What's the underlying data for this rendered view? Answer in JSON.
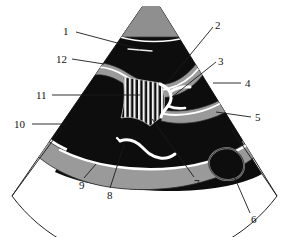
{
  "figure": {
    "type": "ultrasound-sector-scan-diagram",
    "background_color": "#ffffff",
    "sector_fill_color": "#ffffff",
    "tissue_color": "#0d0d0d",
    "band_color": "#9a9a9a",
    "highlight_color": "#ffffff",
    "outline_color": "#222222",
    "transducer_color": "#8f8f8f"
  },
  "labels": [
    {
      "id": "1",
      "text": "1",
      "x": 63,
      "y": 26
    },
    {
      "id": "2",
      "text": "2",
      "x": 215,
      "y": 20
    },
    {
      "id": "3",
      "text": "3",
      "x": 218,
      "y": 56
    },
    {
      "id": "4",
      "text": "4",
      "x": 245,
      "y": 79
    },
    {
      "id": "5",
      "text": "5",
      "x": 255,
      "y": 113
    },
    {
      "id": "6",
      "text": "6",
      "x": 251,
      "y": 219
    },
    {
      "id": "7",
      "text": "7",
      "x": 195,
      "y": 182
    },
    {
      "id": "8",
      "text": "8",
      "x": 108,
      "y": 194
    },
    {
      "id": "9",
      "text": "9",
      "x": 80,
      "y": 184
    },
    {
      "id": "10",
      "text": "10",
      "x": 16,
      "y": 120
    },
    {
      "id": "11",
      "text": "11",
      "x": 38,
      "y": 91
    },
    {
      "id": "12",
      "text": "12",
      "x": 58,
      "y": 55
    }
  ],
  "leader_lines": [
    {
      "id": "leader-1",
      "from": [
        76,
        32
      ],
      "to": [
        140,
        49
      ]
    },
    {
      "id": "leader-2",
      "from": [
        213,
        27
      ],
      "to": [
        167,
        83
      ]
    },
    {
      "id": "leader-3",
      "from": [
        216,
        62
      ],
      "to": [
        172,
        97
      ]
    },
    {
      "id": "leader-4",
      "from": [
        241,
        83
      ],
      "to": [
        213,
        83
      ]
    },
    {
      "id": "leader-5",
      "from": [
        251,
        117
      ],
      "to": [
        216,
        112
      ]
    },
    {
      "id": "leader-6",
      "from": [
        250,
        213
      ],
      "to": [
        235,
        176
      ]
    },
    {
      "id": "leader-7",
      "from": [
        194,
        177
      ],
      "to": [
        152,
        119
      ]
    },
    {
      "id": "leader-8",
      "from": [
        110,
        188
      ],
      "to": [
        124,
        148
      ]
    },
    {
      "id": "leader-9",
      "from": [
        84,
        178
      ],
      "to": [
        96,
        164
      ]
    },
    {
      "id": "leader-10",
      "from": [
        32,
        124
      ],
      "to": [
        66,
        124
      ]
    },
    {
      "id": "leader-11",
      "from": [
        52,
        95
      ],
      "to": [
        140,
        95
      ]
    },
    {
      "id": "leader-12",
      "from": [
        72,
        59
      ],
      "to": [
        104,
        64
      ]
    }
  ],
  "sector": {
    "apex_left_x": 142,
    "apex_right_x": 160,
    "apex_y": 7,
    "outer_arc_label": "sector-outer-boundary",
    "left_edge_label": "sector-left-edge",
    "right_edge_label": "sector-right-edge"
  },
  "structures": [
    {
      "name": "transducer-footprint",
      "shape": "trapezoid",
      "color": "#8f8f8f"
    },
    {
      "name": "upper-tissue-mass",
      "shape": "sector-wedge",
      "color": "#0d0d0d"
    },
    {
      "name": "upper-gray-band",
      "shape": "wavy-band",
      "color": "#9a9a9a"
    },
    {
      "name": "striped-region",
      "shape": "vertical-stripes",
      "color": "#ffffff"
    },
    {
      "name": "y-shaped-vessel",
      "shape": "bifurcation",
      "color": "#ffffff"
    },
    {
      "name": "right-gray-band",
      "shape": "curved-band",
      "color": "#9a9a9a"
    },
    {
      "name": "lower-gray-band",
      "shape": "arc-band",
      "color": "#9a9a9a"
    },
    {
      "name": "lower-white-vessel",
      "shape": "squiggle",
      "color": "#ffffff"
    },
    {
      "name": "teardrop-mass",
      "shape": "teardrop",
      "color": "#0d0d0d"
    }
  ]
}
